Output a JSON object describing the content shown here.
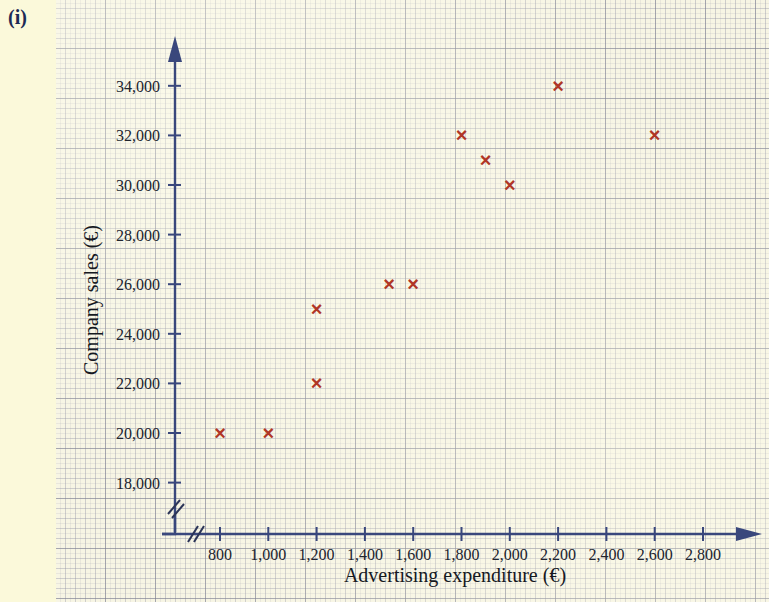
{
  "part_label": "(i)",
  "colors": {
    "margin_background": "#fbf9da",
    "paper_background": "#f7f5e4",
    "axis": "#39477c",
    "marker": "#b03626",
    "text": "#20242e",
    "part_label": "#1d2a55"
  },
  "chart_data": {
    "type": "scatter",
    "title": "",
    "xlabel": "Advertising expenditure (€)",
    "ylabel": "Company sales (€)",
    "xlim": [
      700,
      2900
    ],
    "ylim": [
      17000,
      35000
    ],
    "grid": true,
    "legend": "none",
    "axis_break_x": true,
    "axis_break_y": true,
    "x_tick_labels": [
      "800",
      "1,000",
      "1,200",
      "1,400",
      "1,600",
      "1,800",
      "2,000",
      "2,200",
      "2,400",
      "2,600",
      "2,800"
    ],
    "x_tick_values": [
      800,
      1000,
      1200,
      1400,
      1600,
      1800,
      2000,
      2200,
      2400,
      2600,
      2800
    ],
    "y_tick_labels": [
      "18,000",
      "20,000",
      "22,000",
      "24,000",
      "26,000",
      "28,000",
      "30,000",
      "32,000",
      "34,000"
    ],
    "y_tick_values": [
      18000,
      20000,
      22000,
      24000,
      26000,
      28000,
      30000,
      32000,
      34000
    ],
    "marker_symbol": "×",
    "x": [
      800,
      1000,
      1200,
      1200,
      1500,
      1600,
      1800,
      1900,
      2000,
      2200,
      2600
    ],
    "y": [
      20000,
      20000,
      22000,
      25000,
      26000,
      26000,
      32000,
      31000,
      30000,
      34000,
      32000
    ],
    "points": [
      {
        "x": 800,
        "y": 20000
      },
      {
        "x": 1000,
        "y": 20000
      },
      {
        "x": 1200,
        "y": 22000
      },
      {
        "x": 1200,
        "y": 25000
      },
      {
        "x": 1500,
        "y": 26000
      },
      {
        "x": 1600,
        "y": 26000
      },
      {
        "x": 1800,
        "y": 32000
      },
      {
        "x": 1900,
        "y": 31000
      },
      {
        "x": 2000,
        "y": 30000
      },
      {
        "x": 2200,
        "y": 34000
      },
      {
        "x": 2600,
        "y": 32000
      }
    ]
  }
}
